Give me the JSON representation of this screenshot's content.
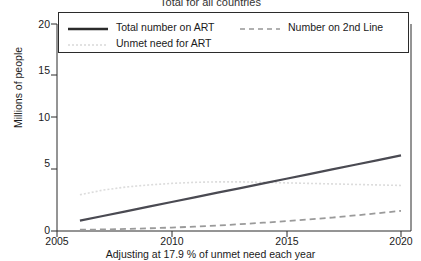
{
  "chart_data": {
    "type": "line",
    "title": "Total for all countries",
    "xlabel": "Adjusting at 17.9 % of unmet need each year",
    "ylabel": "Millions of people",
    "xlim": [
      2005,
      2020
    ],
    "ylim": [
      0,
      20
    ],
    "xticks": [
      2005,
      2010,
      2015,
      2020
    ],
    "xtick_labels": [
      "2005",
      "2010",
      "2015",
      "2020"
    ],
    "yticks": [
      0,
      5,
      10,
      15,
      20
    ],
    "ytick_labels": [
      "0",
      "5",
      "10",
      "15",
      "20"
    ],
    "grid": false,
    "legend_position": "top-inside",
    "series": [
      {
        "name": "Total number on ART",
        "style": "solid",
        "color": "#4a4a52",
        "width": 2.2,
        "x": [
          2006,
          2007,
          2008,
          2009,
          2010,
          2011,
          2012,
          2013,
          2014,
          2015,
          2016,
          2017,
          2018,
          2019,
          2020
        ],
        "values": [
          1.0,
          1.45,
          1.9,
          2.35,
          2.8,
          3.25,
          3.7,
          4.15,
          4.6,
          5.05,
          5.5,
          5.95,
          6.4,
          6.85,
          7.3
        ]
      },
      {
        "name": "Unmet need for ART",
        "style": "dotted",
        "color": "#dcdcdc",
        "width": 1.6,
        "x": [
          2006,
          2007,
          2008,
          2009,
          2010,
          2011,
          2012,
          2013,
          2014,
          2015,
          2016,
          2017,
          2018,
          2019,
          2020
        ],
        "values": [
          3.5,
          3.95,
          4.25,
          4.45,
          4.6,
          4.7,
          4.75,
          4.75,
          4.7,
          4.65,
          4.6,
          4.55,
          4.5,
          4.45,
          4.4
        ]
      },
      {
        "name": "Number on 2nd Line",
        "style": "dashed",
        "color": "#9a9a9a",
        "width": 1.8,
        "x": [
          2006,
          2007,
          2008,
          2009,
          2010,
          2011,
          2012,
          2013,
          2014,
          2015,
          2016,
          2017,
          2018,
          2019,
          2020
        ],
        "values": [
          0.12,
          0.15,
          0.2,
          0.26,
          0.33,
          0.42,
          0.53,
          0.66,
          0.8,
          0.95,
          1.12,
          1.3,
          1.5,
          1.72,
          1.95
        ]
      }
    ]
  },
  "legend": {
    "entries": [
      {
        "label": "Total number on ART",
        "style": "solid"
      },
      {
        "label": "Number on 2nd Line",
        "style": "dashed"
      },
      {
        "label": "Unmet need for ART",
        "style": "dotted"
      }
    ]
  },
  "colors": {
    "axis": "#2b2b2b",
    "solid_series": "#4a4a52",
    "dashed_series": "#9a9a9a",
    "dotted_series": "#dcdcdc",
    "background": "#ffffff"
  }
}
